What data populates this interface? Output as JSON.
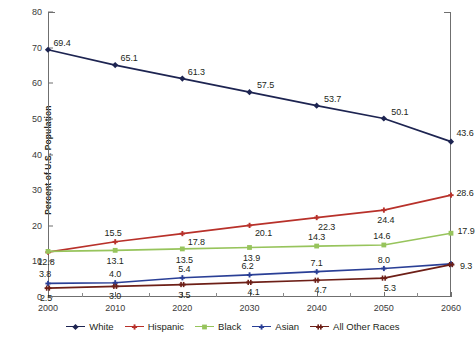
{
  "chart_data": {
    "type": "line",
    "title": "",
    "subtitle": "",
    "xlabel": "",
    "ylabel": "Percent of U.S. Population",
    "categories": [
      "2000",
      "2010",
      "2020",
      "2030",
      "2040",
      "2050",
      "2060"
    ],
    "x": [
      2000,
      2010,
      2020,
      2030,
      2040,
      2050,
      2060
    ],
    "xlim": [
      2000,
      2060
    ],
    "ylim": [
      0,
      80
    ],
    "ytick_labels": [
      "0",
      "10",
      "20",
      "30",
      "40",
      "50",
      "60",
      "70",
      "80"
    ],
    "yticks": [
      0,
      10,
      20,
      30,
      40,
      50,
      60,
      70,
      80
    ],
    "grid": false,
    "legend_position": "bottom",
    "series": [
      {
        "name": "White",
        "color": "#1d2451",
        "marker": "diamond",
        "values": [
          69.4,
          65.1,
          61.3,
          57.5,
          53.7,
          50.1,
          43.6
        ],
        "labels": [
          "69.4",
          "65.1",
          "61.3",
          "57.5",
          "53.7",
          "50.1",
          "43.6"
        ]
      },
      {
        "name": "Hispanic",
        "color": "#b8312a",
        "marker": "cross",
        "values": [
          12.6,
          15.5,
          17.8,
          20.1,
          22.3,
          24.4,
          28.6
        ],
        "labels": [
          "",
          "15.5",
          "17.8",
          "20.1",
          "22.3",
          "24.4",
          "28.6"
        ]
      },
      {
        "name": "Black",
        "color": "#97c45c",
        "marker": "square",
        "values": [
          12.8,
          13.1,
          13.5,
          13.9,
          14.3,
          14.6,
          17.9
        ],
        "labels": [
          "12.8",
          "13.1",
          "13.5",
          "13.9",
          "14.3",
          "14.6",
          "17.9"
        ]
      },
      {
        "name": "Asian",
        "color": "#2a3f96",
        "marker": "plus",
        "values": [
          3.8,
          4.0,
          5.4,
          6.2,
          7.1,
          8.0,
          9.3
        ],
        "labels": [
          "3.8",
          "4.0",
          "5.4",
          "6.2",
          "7.1",
          "8.0",
          "9.3"
        ]
      },
      {
        "name": "All Other Races",
        "color": "#6d1f17",
        "marker": "double-cross",
        "values": [
          2.5,
          3.0,
          3.5,
          4.1,
          4.7,
          5.3,
          9.1
        ],
        "labels": [
          "2.5",
          "3.0",
          "3.5",
          "4.1",
          "4.7",
          "5.3",
          ""
        ]
      }
    ]
  },
  "axis": {
    "y_title": "Percent of U.S. Population"
  },
  "legend": {
    "items": [
      {
        "label": "White"
      },
      {
        "label": "Hispanic"
      },
      {
        "label": "Black"
      },
      {
        "label": "Asian"
      },
      {
        "label": "All Other Races"
      }
    ]
  }
}
